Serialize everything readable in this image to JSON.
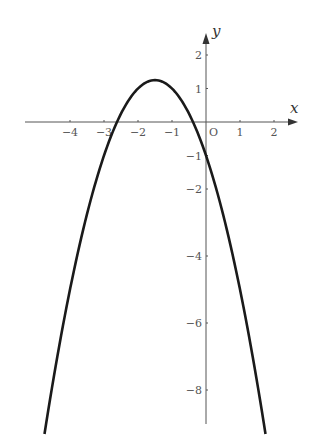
{
  "chart_data": {
    "type": "line",
    "title": "",
    "xlabel": "x",
    "ylabel": "y",
    "origin_label": "O",
    "function": "y = -(x + 1.5)^2 + 1.25",
    "vertex": [
      -1.5,
      1.25
    ],
    "x_intercepts": [
      -2.62,
      -0.38
    ],
    "y_intercept": -1,
    "x_ticks": [
      "-4",
      "-3",
      "-2",
      "-1",
      "1",
      "2"
    ],
    "y_ticks": [
      "2",
      "1",
      "-1",
      "-2",
      "-4",
      "-6",
      "-8"
    ],
    "xlim": [
      -5.4,
      2.6
    ],
    "ylim": [
      -9.3,
      2.5
    ],
    "grid": false,
    "series": [
      {
        "name": "parabola",
        "x": [
          -4.75,
          -4,
          -3,
          -2.62,
          -2,
          -1.5,
          -1,
          -0.38,
          0,
          1,
          1.75
        ],
        "y": [
          -9.31,
          -5,
          -1,
          0,
          1,
          1.25,
          1,
          0,
          -1,
          -5,
          -9.31
        ]
      }
    ]
  }
}
